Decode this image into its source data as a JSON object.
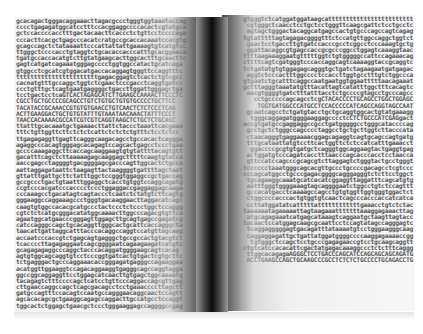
{
  "image": {
    "subject": "open book filled with DNA sequence text",
    "colors": {
      "background": "#ffffff",
      "text": "#3a3a3a",
      "spine": "#0a0a0a"
    }
  },
  "left_page": {
    "lines": [
      "gcacagactgggacaggaaacttagacgccctgggtggtaaataccag",
      "cccctgagagatggcatcctttccacggaggccccacactcgtatgca",
      "gctccaccccacctttgactacaacttcaccctctgttcctccccaga",
      "cccacttcacgctgagcccacatcratgccgcaccacaaatccacgtg",
      "gcagccagctctataaaattcccattattattgaaaagtgtcatgtcc",
      "ttgggctccccacctgtaggtctgcacaccacccatttgcacggaaca",
      "tgatgccaccacatgtcttgtatgaagcacttggcactttgcaacttc",
      "gagtcatgatcagaaatgggagcccctggtggccatactgcatcaga",
      "gtggcctcgcatcgtggacatgaccacaggagtgggttccaggtttc",
      "tttttttttttttttttttttttgagacggagtctcactctgtcgcc",
      "cacnatgtttgccaggctggtctcgaactcccgacctcaggtgatcc",
      "ccctgtttgctcagtgaatgaggggctgaccttggattgggagctga",
      "tcctgactcctcaGTCACTAGAGCATCTTGAAGCCAAAACTTCCCTC",
      "CGCCTGCTGCCCCGCAGCCTGTCTGTGCTGTGTGCCCCTGCTTCC",
      "TACATACCGCAAACCGTGTGTGAACCTGTCAACTCTCTCCCTCAG",
      "ACTTGAAGGACTGCTGTGTATTTGTAAATAACAAACTATTTCCCT",
      "TAACCACAAAACGCCATCGTCGTCAGGTAAGCTCTGCTCTGCAGC",
      "ttatttgcacaaatgctgaaaacttattctaccctaaattcacgaaa",
      "tttctgttggttcttctctctcattctctctctgtttctcctctcc",
      "ttgagagaggttgagttcagggcaagacagcctgccacactcaggga",
      "agaggcccacagtgggagcacagagtccagcactgagcctccctgaa",
      "gccccaaagaggcttcaccagcaaggaagtgtgtattttacagtgtt",
      "gacatttcagctcttaaaaagagcaaggagctttttcaagtgtatca",
      "aaccgagcctaggggtgacggggagcgacccagttggcactctgcca",
      "aattaggagataattctaagagttactaaggggtgattttagctaat",
      "gttatttgattgcttctatttggctccgggtggaggccgctgaccag",
      "gccgccctgactgtaatttggaggctcacctgtggtccaggcagatg",
      "ccgtcccacgatcccacccctccctggaggaccgaggaggagcaaga",
      "cccaaagcctgacatagtcagtaccctcaatctctatgtcttcagtg",
      "gggaaggccaggaaagccctgggtgacaaggaacttaggacatcagc",
      "caagtgtggccacacgcatgccctactccctctccctggctccaggg",
      "cgtctctcatgcgggacatatggcaaaacttggcccagacgtgttca",
      "agaatggcatgaacccgggagttggagcttgcagtgagccgagatcg",
      "catccagggccagctgcacaggttgggcactgcattcaccagggcta",
      "taacattgattaggcatttacccacaggccaggtccatgttagcaag",
      "accaatcccaccgtctgagcagtgagggctgccgccactgtacgtct",
      "tcaccccttagagaggaatcagcggggaatcagaagaagatcatgtc",
      "gcagagagaggcccaggctacccacaggatggggaagcagtcacag",
      "agtgtggcagcaggtgtcctcccggtgatcactgtgactcgtgcttc",
      "tctgagggactgcccaggaaacaccgggagatgagggccagaaggaa",
      "acatggttggaaggtccagacaggaaggtgagggcagccaggtagga",
      "ggccggcaggaggttcctggagcatcaacttgtgagctggcaaaatg",
      "tacagagtctttccccagctcatcctgttcccaggaccagcgttgag",
      "cttgaaccaggccagctcagcgacagcctcctgaaaccccttagctt",
      "gatgccagtttccacagtccaatgccagggaacaggcaactccagtt",
      "agcacacagcgctgaaggcagagccaggacttgccatgcctccaggt",
      "tggcactctggagctgaacgctccctgggaaggagccaggggccgag"
    ]
  },
  "right_page": {
    "lines": [
      "gtgggtctcatggatggataagcatttttttttttttttttttttttt",
      "cgtgggctcaacctcctgctcctgggttcaagcgattctcctgcctc",
      "agtagctgggactacaggcatgagccactgtgcccagccagtcagag",
      "tgtatttttagtagagacggggtttctccatgttggccaggctggtct",
      "gaactcctgaccttgtgatccacccgcctcggcctcccaaagtgctg",
      "ggattacaggcgtgagccaccgcgcccggcctggagtcaaaggtaac",
      "ttttaagaaaggaatgtttttggtctgtgggggccattccagaaacag",
      "cttttcagtcgatgggtcccaccaggcagtcaaaaggtaccgcaggtc",
      "tctgatatgtgtggagagcagggtgctgatctagaagaatgatgagac",
      "aggtctcccactttggcccctccaccttggtgcctttgtctggccca",
      "gtgaatctgcatttcaggccaatgaatggtggaatttttaacagaaat",
      "gctttagggtaaatatgtttacattagtcatatttggctttcacagtc",
      "aacgtggggtgatctttatttacctctgccccgtagcctgcccagcc",
      "cctgcccccagcagcctcgCTACACCCCTGCAGCCTGGCTGGAGC",
      "TGGTGATGGCCCATGCCTCCACCCCCATCAGCCAGGTAGCCAAT",
      "gcaatcagcctctgatgtacctgctgcaggtggcactgtatgaaagg",
      "tgggcaggagatggggaaggagcccctcCTCTGCCCATCGAGgact",
      "accgtgatgccgaggaggccgcctgatgggggcctgggcataccccag",
      "gcctgctctgggccagcccctaggcctgctgcttggtcttacccata",
      "ctaacagggtgaggaaaacggagcagaggtcagtgcagccagtgatg",
      "tttgcataattatgtccttcactggttctctccatcatttgaaacct",
      "ggaccccgcgtgtgatgctcagggtggcaggaagtactgaggtgag",
      "actggatgtcccagatcacctttaacccagcacccacctcctaacca",
      "gttccatccagcccgcagcgtcttaggagtctgggtactgcctgggt",
      "tcccccctaaatgggcagcacgttgccctgccccgacagcctcgtccc",
      "cccagcatggcctgcccgagacggggcagggagggtctcttcctggct",
      "tgcagaaggcaaatgcatcacatcggaggttaggatttcagcatgtg",
      "aatttgggtggggaaagtagcaggggaatctggcctgtctccagttt",
      "gccacatgacctcaaaagccagcctgtgtggttggtgggtggactct",
      "ctggccccacccactgtggtgtcaactcagcccacccaccatcatca",
      "ccttatggatatcatttttattttttttttttgaaacctgtctctac",
      "taaaaaatagaaaaattagtaagaaatttttttaaaggagaaacttag",
      "atgcagagaaatcatgagcataaagtcaggaatgctaagttagtacc",
      "tacaactccatggagcaagcgcaattcctccagtatagccagggagtc",
      "tcaggagggggagtgacagatttataaaatgtcctgggaagggcaag",
      "caggaggagattgctgattatggatggggccccaaggagaaaaccgg",
      "tgtgggctccagctcctgcccgagagaaccgtcctgcaagcaggtt",
      "ctgtcatccacacattcgactatgagacaaaggccctctctttcaggg",
      "ttggcacagagaAGGGCTCCTGACCCAGCATCCAGCAGCAGCAGATG",
      "ACCTGAAGCCAGCTGCAAGCCCGCCTCTCTCTGCCCCTGCAGACCTG"
    ]
  }
}
